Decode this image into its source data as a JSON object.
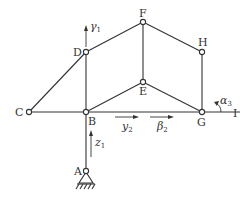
{
  "diagram": {
    "type": "multibody-linkage-graph",
    "nodes": [
      {
        "id": "A",
        "label": "A",
        "x": 86,
        "y": 172,
        "support": "pin-ground"
      },
      {
        "id": "B",
        "label": "B",
        "x": 86,
        "y": 112
      },
      {
        "id": "C",
        "label": "C",
        "x": 29,
        "y": 112
      },
      {
        "id": "D",
        "label": "D",
        "x": 86,
        "y": 52
      },
      {
        "id": "E",
        "label": "E",
        "x": 143,
        "y": 82
      },
      {
        "id": "F",
        "label": "F",
        "x": 143,
        "y": 22
      },
      {
        "id": "G",
        "label": "G",
        "x": 202,
        "y": 112
      },
      {
        "id": "H",
        "label": "H",
        "x": 202,
        "y": 52
      },
      {
        "id": "I",
        "label": "I",
        "x": 240,
        "y": 112
      }
    ],
    "edges": [
      [
        "A",
        "B"
      ],
      [
        "B",
        "C"
      ],
      [
        "C",
        "D"
      ],
      [
        "B",
        "D"
      ],
      [
        "D",
        "F"
      ],
      [
        "B",
        "E"
      ],
      [
        "E",
        "F"
      ],
      [
        "F",
        "H"
      ],
      [
        "E",
        "G"
      ],
      [
        "H",
        "G"
      ],
      [
        "B",
        "G"
      ],
      [
        "G",
        "I"
      ]
    ],
    "annotations": [
      {
        "id": "gamma1",
        "symbol": "γ",
        "sub": "1",
        "kind": "arrow-up",
        "near": "D"
      },
      {
        "id": "z1",
        "symbol": "z",
        "sub": "1",
        "kind": "arrow-up",
        "near": "AB"
      },
      {
        "id": "y2",
        "symbol": "y",
        "sub": "2",
        "kind": "arrow-right",
        "near": "BG"
      },
      {
        "id": "beta2",
        "symbol": "β",
        "sub": "2",
        "kind": "arrow-right",
        "near": "BG"
      },
      {
        "id": "alpha3",
        "symbol": "α",
        "sub": "3",
        "kind": "rotation-arrow",
        "near": "G"
      }
    ]
  },
  "labels": {
    "A": "A",
    "B": "B",
    "C": "C",
    "D": "D",
    "E": "E",
    "F": "F",
    "G": "G",
    "H": "H",
    "I": "I",
    "gamma": "γ",
    "gamma_sub": "1",
    "z": "z",
    "z_sub": "1",
    "y": "y",
    "y_sub": "2",
    "beta": "β",
    "beta_sub": "2",
    "alpha": "α",
    "alpha_sub": "3"
  }
}
